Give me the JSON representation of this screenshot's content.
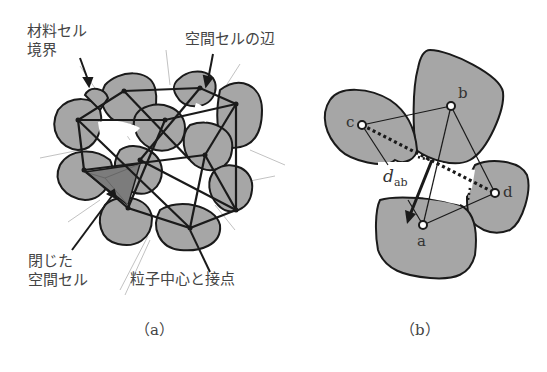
{
  "panel_a": {
    "caption": "（a）",
    "labels": {
      "material_cell_boundary_1": "材料セル",
      "material_cell_boundary_2": "境界",
      "void_cell_edge": "空間セルの辺",
      "closed_void_cell_1": "閉じた",
      "closed_void_cell_2": "空間セル",
      "particle_center_contact": "粒子中心と接点"
    }
  },
  "panel_b": {
    "caption": "（b）",
    "points": {
      "a": "a",
      "b": "b",
      "c": "c",
      "d": "d"
    },
    "distance_label": "d",
    "distance_subscript": "ab"
  },
  "colors": {
    "particle_fill": "#a6a6a6",
    "closed_cell_fill": "#7c7c7c",
    "outline": "#1a1a1a",
    "guide_line": "#bdbdbd",
    "background": "#ffffff"
  }
}
